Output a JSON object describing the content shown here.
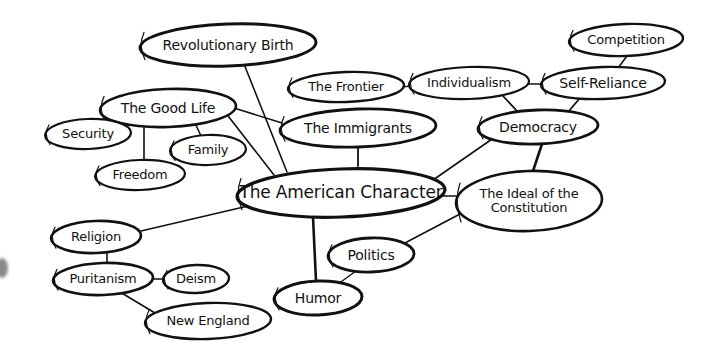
{
  "diagram": {
    "type": "concept-map",
    "central_topic": "The American Character",
    "nodes": [
      {
        "id": "american_character",
        "label": "The American Character",
        "cx": 341,
        "cy": 193,
        "rx": 104,
        "ry": 24,
        "font": 17,
        "stroke": 3.2
      },
      {
        "id": "revolutionary_birth",
        "label": "Revolutionary Birth",
        "cx": 228,
        "cy": 45,
        "rx": 88,
        "ry": 21,
        "font": 14,
        "stroke": 3
      },
      {
        "id": "good_life",
        "label": "The Good Life",
        "cx": 168,
        "cy": 108,
        "rx": 68,
        "ry": 19,
        "font": 14,
        "stroke": 2.6
      },
      {
        "id": "security",
        "label": "Security",
        "cx": 88,
        "cy": 134,
        "rx": 43,
        "ry": 15,
        "font": 13,
        "stroke": 2.2
      },
      {
        "id": "family",
        "label": "Family",
        "cx": 208,
        "cy": 150,
        "rx": 38,
        "ry": 15,
        "font": 13,
        "stroke": 2.2
      },
      {
        "id": "freedom",
        "label": "Freedom",
        "cx": 140,
        "cy": 175,
        "rx": 45,
        "ry": 15,
        "font": 13,
        "stroke": 2.2
      },
      {
        "id": "immigrants",
        "label": "The Immigrants",
        "cx": 358,
        "cy": 128,
        "rx": 78,
        "ry": 19,
        "font": 14,
        "stroke": 2.8
      },
      {
        "id": "frontier",
        "label": "The Frontier",
        "cx": 346,
        "cy": 87,
        "rx": 58,
        "ry": 15,
        "font": 13,
        "stroke": 2.4
      },
      {
        "id": "individualism",
        "label": "Individualism",
        "cx": 469,
        "cy": 83,
        "rx": 60,
        "ry": 16,
        "font": 13,
        "stroke": 2.2
      },
      {
        "id": "self_reliance",
        "label": "Self-Reliance",
        "cx": 603,
        "cy": 83,
        "rx": 62,
        "ry": 16,
        "font": 14,
        "stroke": 2.4
      },
      {
        "id": "competition",
        "label": "Competition",
        "cx": 626,
        "cy": 40,
        "rx": 57,
        "ry": 16,
        "font": 13,
        "stroke": 2.4
      },
      {
        "id": "democracy",
        "label": "Democracy",
        "cx": 538,
        "cy": 127,
        "rx": 60,
        "ry": 17,
        "font": 14,
        "stroke": 2.8
      },
      {
        "id": "ideal_constitution",
        "label": "The Ideal of the\nConstitution",
        "cx": 529,
        "cy": 201,
        "rx": 73,
        "ry": 30,
        "font": 13,
        "stroke": 2.6
      },
      {
        "id": "politics",
        "label": "Politics",
        "cx": 371,
        "cy": 255,
        "rx": 43,
        "ry": 17,
        "font": 14,
        "stroke": 2.8
      },
      {
        "id": "humor",
        "label": "Humor",
        "cx": 318,
        "cy": 298,
        "rx": 44,
        "ry": 17,
        "font": 14,
        "stroke": 3
      },
      {
        "id": "religion",
        "label": "Religion",
        "cx": 96,
        "cy": 237,
        "rx": 45,
        "ry": 16,
        "font": 13,
        "stroke": 2.6
      },
      {
        "id": "puritanism",
        "label": "Puritanism",
        "cx": 103,
        "cy": 279,
        "rx": 50,
        "ry": 16,
        "font": 13,
        "stroke": 2.6
      },
      {
        "id": "deism",
        "label": "Deism",
        "cx": 196,
        "cy": 279,
        "rx": 33,
        "ry": 14,
        "font": 13,
        "stroke": 2.4
      },
      {
        "id": "new_england",
        "label": "New England",
        "cx": 208,
        "cy": 321,
        "rx": 63,
        "ry": 18,
        "font": 13,
        "stroke": 2.4
      }
    ],
    "edges": [
      {
        "from": "revolutionary_birth",
        "to": "american_character",
        "x1": 242,
        "y1": 59,
        "x2": 287,
        "y2": 172,
        "w": 1.6
      },
      {
        "from": "good_life",
        "to": "american_character",
        "x1": 225,
        "y1": 112,
        "x2": 274,
        "y2": 175,
        "w": 1.6
      },
      {
        "from": "good_life",
        "to": "immigrants",
        "x1": 234,
        "y1": 108,
        "x2": 282,
        "y2": 123,
        "w": 1.6
      },
      {
        "from": "good_life",
        "to": "security",
        "x1": 110,
        "y1": 116,
        "x2": 103,
        "y2": 122,
        "w": 1.6
      },
      {
        "from": "good_life",
        "to": "freedom",
        "x1": 144,
        "y1": 124,
        "x2": 144,
        "y2": 160,
        "w": 1.6
      },
      {
        "from": "good_life",
        "to": "family",
        "x1": 195,
        "y1": 123,
        "x2": 201,
        "y2": 136,
        "w": 1.6
      },
      {
        "from": "immigrants",
        "to": "american_character",
        "x1": 358,
        "y1": 144,
        "x2": 358,
        "y2": 166,
        "w": 1.8
      },
      {
        "from": "frontier",
        "to": "individualism",
        "x1": 401,
        "y1": 87,
        "x2": 411,
        "y2": 86,
        "w": 1.6
      },
      {
        "from": "individualism",
        "to": "self_reliance",
        "x1": 527,
        "y1": 84,
        "x2": 543,
        "y2": 84,
        "w": 1.6
      },
      {
        "from": "competition",
        "to": "self_reliance",
        "x1": 627,
        "y1": 56,
        "x2": 618,
        "y2": 68,
        "w": 1.6
      },
      {
        "from": "individualism",
        "to": "democracy",
        "x1": 503,
        "y1": 96,
        "x2": 518,
        "y2": 112,
        "w": 1.8
      },
      {
        "from": "self_reliance",
        "to": "democracy",
        "x1": 580,
        "y1": 98,
        "x2": 568,
        "y2": 112,
        "w": 1.8
      },
      {
        "from": "democracy",
        "to": "american_character",
        "x1": 495,
        "y1": 137,
        "x2": 433,
        "y2": 180,
        "w": 1.6
      },
      {
        "from": "democracy",
        "to": "ideal_constitution",
        "x1": 542,
        "y1": 144,
        "x2": 533,
        "y2": 171,
        "w": 2.6
      },
      {
        "from": "american_character",
        "to": "ideal_constitution",
        "x1": 443,
        "y1": 196,
        "x2": 458,
        "y2": 196,
        "w": 1.6
      },
      {
        "from": "ideal_constitution",
        "to": "politics",
        "x1": 460,
        "y1": 214,
        "x2": 403,
        "y2": 244,
        "w": 1.6
      },
      {
        "from": "american_character",
        "to": "humor",
        "x1": 313,
        "y1": 217,
        "x2": 316,
        "y2": 281,
        "w": 2.6
      },
      {
        "from": "politics",
        "to": "humor",
        "x1": 356,
        "y1": 271,
        "x2": 338,
        "y2": 284,
        "w": 1.4
      },
      {
        "from": "american_character",
        "to": "religion",
        "x1": 248,
        "y1": 206,
        "x2": 141,
        "y2": 231,
        "w": 1.6
      },
      {
        "from": "religion",
        "to": "puritanism",
        "x1": 107,
        "y1": 253,
        "x2": 107,
        "y2": 263,
        "w": 1.6
      },
      {
        "from": "puritanism",
        "to": "deism",
        "x1": 153,
        "y1": 279,
        "x2": 163,
        "y2": 279,
        "w": 1.6
      },
      {
        "from": "puritanism",
        "to": "new_england",
        "x1": 120,
        "y1": 292,
        "x2": 155,
        "y2": 313,
        "w": 1.6
      }
    ]
  }
}
